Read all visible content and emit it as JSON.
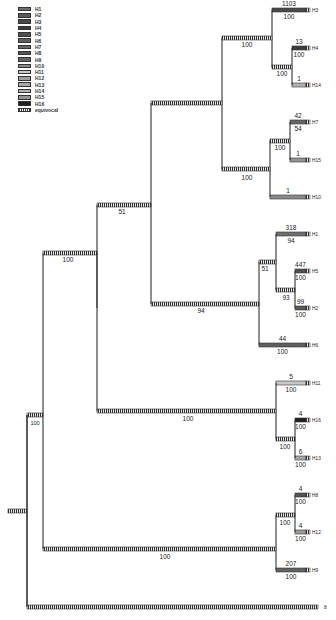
{
  "legend": {
    "items": [
      {
        "label": "H1",
        "color": "#6e6e6e"
      },
      {
        "label": "H2",
        "color": "#5a5a5a"
      },
      {
        "label": "H3",
        "color": "#4a4a4a"
      },
      {
        "label": "H4",
        "color": "#3e3e3e"
      },
      {
        "label": "H5",
        "color": "#505050"
      },
      {
        "label": "H6",
        "color": "#5e5e5e"
      },
      {
        "label": "H7",
        "color": "#686868"
      },
      {
        "label": "H8",
        "color": "#545454"
      },
      {
        "label": "H9",
        "color": "#626262"
      },
      {
        "label": "H10",
        "color": "#8a8a8a"
      },
      {
        "label": "H11",
        "color": "#c8c8c8"
      },
      {
        "label": "H12",
        "color": "#9e9e9e"
      },
      {
        "label": "H13",
        "color": "#a8a8a8"
      },
      {
        "label": "H14",
        "color": "#b2b2b2"
      },
      {
        "label": "H15",
        "color": "#949494"
      },
      {
        "label": "H16",
        "color": "#202020"
      },
      {
        "label": "equivocal",
        "color": "hatched"
      }
    ]
  },
  "tree": {
    "leaves": [
      {
        "id": "H3",
        "label": "H3",
        "y": 10,
        "count": "1103",
        "support": "100",
        "color": "#4a4a4a"
      },
      {
        "id": "H4",
        "label": "H4",
        "y": 48,
        "count": "13",
        "support": "100",
        "color": "#3e3e3e"
      },
      {
        "id": "H14",
        "label": "H14",
        "y": 85,
        "count": "1",
        "support": "",
        "color": "#b2b2b2"
      },
      {
        "id": "H7",
        "label": "H7",
        "y": 122,
        "count": "42",
        "support": "54",
        "color": "#686868"
      },
      {
        "id": "H15",
        "label": "H15",
        "y": 160,
        "count": "1",
        "support": "",
        "color": "#949494"
      },
      {
        "id": "H10",
        "label": "H10",
        "y": 197,
        "count": "1",
        "support": "",
        "color": "#8a8a8a"
      },
      {
        "id": "H1",
        "label": "H1",
        "y": 234,
        "count": "318",
        "support": "94",
        "color": "#6e6e6e"
      },
      {
        "id": "H5",
        "label": "H5",
        "y": 271,
        "count": "447",
        "support": "100",
        "color": "#505050"
      },
      {
        "id": "H2",
        "label": "H2",
        "y": 308,
        "count": "99",
        "support": "100",
        "color": "#5a5a5a"
      },
      {
        "id": "H6",
        "label": "H6",
        "y": 345,
        "count": "44",
        "support": "100",
        "color": "#5e5e5e"
      },
      {
        "id": "H11",
        "label": "H11",
        "y": 383,
        "count": "5",
        "support": "100",
        "color": "#c8c8c8"
      },
      {
        "id": "H16",
        "label": "H16",
        "y": 420,
        "count": "4",
        "support": "100",
        "color": "#202020"
      },
      {
        "id": "H13",
        "label": "H13",
        "y": 458,
        "count": "6",
        "support": "100",
        "color": "#a8a8a8"
      },
      {
        "id": "H8",
        "label": "H8",
        "y": 495,
        "count": "4",
        "support": "100",
        "color": "#545454"
      },
      {
        "id": "H12",
        "label": "H12",
        "y": 532,
        "count": "4",
        "support": "100",
        "color": "#9e9e9e"
      },
      {
        "id": "H9",
        "label": "H9",
        "y": 570,
        "count": "207",
        "support": "100",
        "color": "#626262"
      },
      {
        "id": "outgroup",
        "label": "8",
        "y": 607,
        "count": "",
        "support": "",
        "color": "hatched"
      }
    ],
    "internal_support": [
      {
        "node": "H4+H14",
        "value": "100"
      },
      {
        "node": "H3+H4+H14",
        "value": "100"
      },
      {
        "node": "H7+H15",
        "value": "100"
      },
      {
        "node": "H7+H15+H10",
        "value": "100"
      },
      {
        "node": "upper-clade",
        "value": "51"
      },
      {
        "node": "H5+H2",
        "value": "93"
      },
      {
        "node": "H1+H5+H2",
        "value": "81"
      },
      {
        "node": "H1-H6 clade",
        "value": "94"
      },
      {
        "node": "ingroup-top",
        "value": "100"
      },
      {
        "node": "H11-H13 clade",
        "value": "100"
      },
      {
        "node": "H16+H13",
        "value": "100"
      },
      {
        "node": "H8+H12",
        "value": "100"
      },
      {
        "node": "H8-H9 clade",
        "value": "100"
      },
      {
        "node": "ingroup",
        "value": "100"
      }
    ]
  }
}
